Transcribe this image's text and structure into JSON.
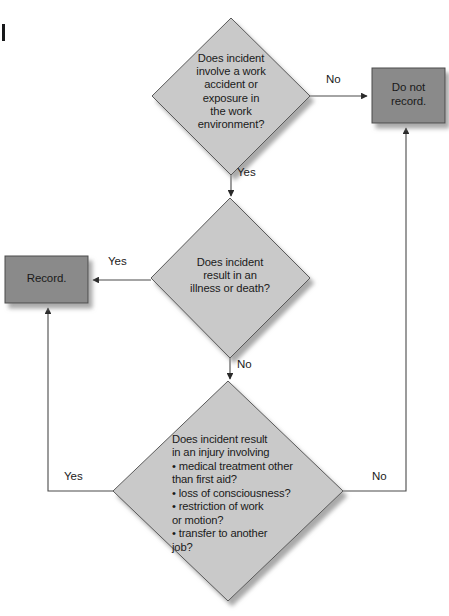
{
  "diagram": {
    "type": "flowchart",
    "colors": {
      "diamond_fill": "#c9c9c9",
      "box_fill": "#8a8a8a",
      "stroke": "#4a4a4a",
      "text": "#1a1a1a",
      "background": "#ffffff",
      "shadow": "#b4b4b4"
    }
  },
  "nodes": {
    "decision_1": {
      "shape": "diamond",
      "text": "Does incident\ninvolve a work\naccident or\nexposure in\nthe work\nenvironment?"
    },
    "decision_2": {
      "shape": "diamond",
      "text": "Does incident\nresult in an\nillness or death?"
    },
    "decision_3": {
      "shape": "diamond",
      "heading": "Does incident result\nin an injury involving",
      "bullets": [
        "• medical treatment other\n   than first aid?",
        "• loss of consciousness?",
        "• restriction of work\n   or motion?",
        "• transfer to another\n   job?"
      ],
      "full_text": "Does incident result\nin an injury involving\n• medical treatment other\n   than first aid?\n• loss of consciousness?\n• restriction of work\n   or motion?\n• transfer to another\n   job?"
    },
    "terminal_do_not_record": {
      "shape": "rect",
      "text": "Do not\nrecord."
    },
    "terminal_record": {
      "shape": "rect",
      "text": "Record."
    }
  },
  "edges": {
    "d1_no": {
      "label": "No",
      "from": "decision_1",
      "to": "terminal_do_not_record"
    },
    "d1_yes": {
      "label": "Yes",
      "from": "decision_1",
      "to": "decision_2"
    },
    "d2_yes": {
      "label": "Yes",
      "from": "decision_2",
      "to": "terminal_record"
    },
    "d2_no": {
      "label": "No",
      "from": "decision_2",
      "to": "decision_3"
    },
    "d3_yes": {
      "label": "Yes",
      "from": "decision_3",
      "to": "terminal_record"
    },
    "d3_no": {
      "label": "No",
      "from": "decision_3",
      "to": "terminal_do_not_record"
    }
  }
}
